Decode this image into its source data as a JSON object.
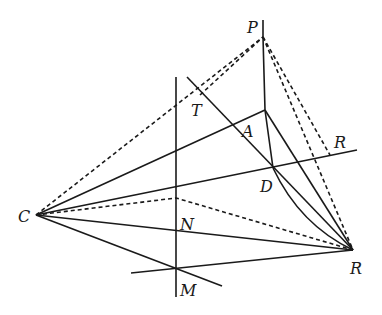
{
  "diagram": {
    "type": "geometry-construction",
    "points": {
      "P": {
        "x": 263,
        "y": 37
      },
      "A": {
        "x": 265,
        "y": 110
      },
      "D": {
        "x": 273,
        "y": 168
      },
      "C": {
        "x": 36,
        "y": 215
      },
      "R_bottom": {
        "x": 353,
        "y": 250
      },
      "M": {
        "x": 176,
        "y": 268
      },
      "N": {
        "x": 176,
        "y": 198
      },
      "T": {
        "x": 200,
        "y": 95
      }
    },
    "labels": [
      {
        "id": "P",
        "text": "P",
        "x": 247,
        "y": 33
      },
      {
        "id": "T",
        "text": "T",
        "x": 191,
        "y": 116
      },
      {
        "id": "A",
        "text": "A",
        "x": 242,
        "y": 137
      },
      {
        "id": "R_top",
        "text": "R",
        "x": 334,
        "y": 148
      },
      {
        "id": "D",
        "text": "D",
        "x": 260,
        "y": 192
      },
      {
        "id": "C",
        "text": "C",
        "x": 18,
        "y": 222
      },
      {
        "id": "N",
        "text": "N",
        "x": 180,
        "y": 230
      },
      {
        "id": "R_bottom",
        "text": "R",
        "x": 350,
        "y": 274
      },
      {
        "id": "M",
        "text": "M",
        "x": 180,
        "y": 296
      }
    ]
  }
}
